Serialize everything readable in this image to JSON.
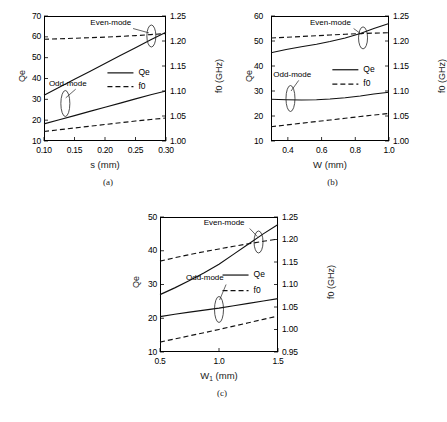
{
  "figure": {
    "panel_captions": [
      "(a)",
      "(b)",
      "(c)"
    ],
    "legend_labels": {
      "qe": "Qe",
      "f0": "f0"
    },
    "annotations": {
      "even": "Even-mode",
      "odd": "Odd-mode"
    }
  },
  "chart_data": [
    {
      "type": "line",
      "title": "(a)",
      "xlabel": "s (mm)",
      "ylabel": "Qe",
      "y2label": "f0 (GHz)",
      "xlim": [
        0.1,
        0.3
      ],
      "ylim": [
        10,
        70
      ],
      "y2lim": [
        1.0,
        1.25
      ],
      "xticks": [
        "0.10",
        "0.15",
        "0.20",
        "0.25",
        "0.30"
      ],
      "xtickvals": [
        0.1,
        0.15,
        0.2,
        0.25,
        0.3
      ],
      "yticks": [
        "10",
        "20",
        "30",
        "40",
        "50",
        "60",
        "70"
      ],
      "ytickvals": [
        10,
        20,
        30,
        40,
        50,
        60,
        70
      ],
      "y2ticks": [
        "1.00",
        "1.05",
        "1.10",
        "1.15",
        "1.20",
        "1.25"
      ],
      "y2tickvals": [
        1.0,
        1.05,
        1.1,
        1.15,
        1.2,
        1.25
      ],
      "grid": false,
      "legend_position": "center-right",
      "x": [
        0.1,
        0.125,
        0.15,
        0.175,
        0.2,
        0.225,
        0.25,
        0.275,
        0.3
      ],
      "series": [
        {
          "name": "Qe even-mode",
          "axis": "left",
          "style": "solid",
          "values": [
            32.0,
            35.8,
            39.6,
            43.4,
            47.2,
            51.0,
            54.8,
            58.6,
            62.2
          ]
        },
        {
          "name": "Qe odd-mode",
          "axis": "left",
          "style": "solid",
          "values": [
            18.2,
            20.2,
            22.2,
            24.2,
            26.2,
            28.2,
            30.2,
            32.2,
            34.0
          ]
        },
        {
          "name": "f0 even-mode",
          "axis": "right",
          "style": "dashed",
          "values": [
            1.2035,
            1.2045,
            1.2055,
            1.2065,
            1.2078,
            1.2092,
            1.2108,
            1.2128,
            1.215
          ]
        },
        {
          "name": "f0 odd-mode",
          "axis": "right",
          "style": "dashed",
          "values": [
            1.019,
            1.0225,
            1.026,
            1.0295,
            1.033,
            1.0365,
            1.04,
            1.043,
            1.046
          ]
        }
      ]
    },
    {
      "type": "line",
      "title": "(b)",
      "xlabel": "W (mm)",
      "ylabel": "Qe",
      "y2label": "f0 (GHz)",
      "xlim": [
        0.3,
        1.0
      ],
      "ylim": [
        10,
        60
      ],
      "y2lim": [
        1.0,
        1.25
      ],
      "xticks": [
        "0.4",
        "0.6",
        "0.8",
        "1.0"
      ],
      "xtickvals": [
        0.4,
        0.6,
        0.8,
        1.0
      ],
      "yticks": [
        "10",
        "20",
        "30",
        "40",
        "50",
        "60"
      ],
      "ytickvals": [
        10,
        20,
        30,
        40,
        50,
        60
      ],
      "y2ticks": [
        "1.00",
        "1.05",
        "1.10",
        "1.15",
        "1.20",
        "1.25"
      ],
      "y2tickvals": [
        1.0,
        1.05,
        1.1,
        1.15,
        1.2,
        1.25
      ],
      "grid": false,
      "legend_position": "center-right",
      "x": [
        0.3,
        0.39,
        0.48,
        0.57,
        0.65,
        0.74,
        0.83,
        0.91,
        1.0
      ],
      "series": [
        {
          "name": "Qe even-mode",
          "axis": "left",
          "style": "solid",
          "values": [
            45.3,
            46.6,
            47.7,
            48.7,
            49.8,
            51.2,
            53.0,
            55.0,
            57.0
          ]
        },
        {
          "name": "Qe odd-mode",
          "axis": "left",
          "style": "solid",
          "values": [
            26.7,
            26.5,
            26.4,
            26.5,
            26.8,
            27.3,
            28.0,
            28.8,
            29.5
          ]
        },
        {
          "name": "f0 even-mode",
          "axis": "right",
          "style": "dashed",
          "values": [
            1.206,
            1.2075,
            1.209,
            1.2105,
            1.212,
            1.2135,
            1.2148,
            1.2158,
            1.2165
          ]
        },
        {
          "name": "f0 odd-mode",
          "axis": "right",
          "style": "dashed",
          "values": [
            1.0285,
            1.032,
            1.0355,
            1.039,
            1.042,
            1.0455,
            1.049,
            1.052,
            1.055
          ]
        }
      ]
    },
    {
      "type": "line",
      "title": "(c)",
      "xlabel": "W1 (mm)",
      "xlabel_base": "W",
      "xlabel_sub": "1",
      "xlabel_unit": " (mm)",
      "ylabel": "Qe",
      "y2label": "f0 (GHz)",
      "xlim": [
        0.5,
        1.5
      ],
      "ylim": [
        10,
        50
      ],
      "y2lim": [
        0.95,
        1.25
      ],
      "xticks": [
        "0.5",
        "1.0",
        "1.5"
      ],
      "xtickvals": [
        0.5,
        1.0,
        1.5
      ],
      "yticks": [
        "10",
        "20",
        "30",
        "40",
        "50"
      ],
      "ytickvals": [
        10,
        20,
        30,
        40,
        50
      ],
      "y2ticks": [
        "0.95",
        "1.00",
        "1.05",
        "1.10",
        "1.15",
        "1.20",
        "1.25"
      ],
      "y2tickvals": [
        0.95,
        1.0,
        1.05,
        1.1,
        1.15,
        1.2,
        1.25
      ],
      "grid": false,
      "legend_position": "center-right",
      "x": [
        0.5,
        0.625,
        0.75,
        0.875,
        1.0,
        1.125,
        1.25,
        1.375,
        1.5
      ],
      "series": [
        {
          "name": "Qe even-mode",
          "axis": "left",
          "style": "solid",
          "values": [
            27.0,
            29.0,
            31.2,
            33.5,
            36.0,
            39.0,
            42.0,
            45.0,
            47.8
          ]
        },
        {
          "name": "Qe odd-mode",
          "axis": "left",
          "style": "solid",
          "values": [
            20.5,
            21.2,
            21.8,
            22.4,
            23.0,
            23.7,
            24.4,
            25.1,
            25.8
          ]
        },
        {
          "name": "f0 even-mode",
          "axis": "right",
          "style": "dashed",
          "values": [
            1.152,
            1.1595,
            1.1665,
            1.173,
            1.179,
            1.185,
            1.1905,
            1.196,
            1.201
          ]
        },
        {
          "name": "f0 odd-mode",
          "axis": "right",
          "style": "dashed",
          "values": [
            0.972,
            0.979,
            0.986,
            0.993,
            1.0,
            1.0075,
            1.015,
            1.0225,
            1.03
          ]
        }
      ]
    }
  ]
}
